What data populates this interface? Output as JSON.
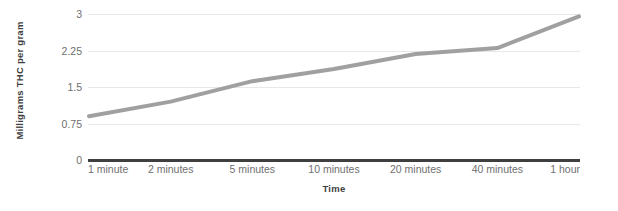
{
  "chart_data": {
    "type": "line",
    "title": "",
    "xlabel": "Time",
    "ylabel": "Milligrams THC per gram",
    "categories": [
      "1 minute",
      "2 minutes",
      "5 minutes",
      "10 minutes",
      "20 minutes",
      "40 minutes",
      "1 hour"
    ],
    "values": [
      0.9,
      1.2,
      1.62,
      1.87,
      2.18,
      2.3,
      2.95
    ],
    "series": [
      {
        "name": "Milligrams THC per gram",
        "values": [
          0.9,
          1.2,
          1.62,
          1.87,
          2.18,
          2.3,
          2.95
        ],
        "color": "#a0a0a0"
      }
    ],
    "ylim": [
      0,
      3
    ],
    "yticks": [
      3,
      2.25,
      1.5,
      0.75,
      0
    ],
    "ytick_labels": [
      "3",
      "2.25",
      "1.5",
      "0.75",
      "0"
    ],
    "grid": true,
    "gridlines": [
      3,
      2.25,
      1.5,
      0.75
    ],
    "legend": "none",
    "axis_color": "#3f3f3f",
    "grid_color": "#e8e8e8",
    "tick_label_color": "#6f6f6f"
  }
}
